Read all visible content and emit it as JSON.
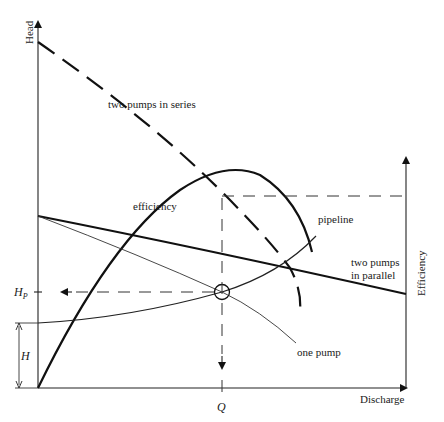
{
  "diagram": {
    "type": "pump performance / system characteristic curves",
    "axes": {
      "y_left_label": "Head",
      "x_label": "Discharge",
      "y_right_label": "Efficiency"
    },
    "curves": {
      "series": "two pumps in series",
      "efficiency": "efficiency",
      "pipeline": "pipeline",
      "parallel_line1": "two pumps",
      "parallel_line2": "in parallel",
      "one_pump": "one pump"
    },
    "markers": {
      "operating_head": "H",
      "operating_head_sub": "P",
      "static_head": "H",
      "operating_discharge": "Q"
    },
    "colors": {
      "ink": "#111111",
      "background": "#ffffff"
    }
  }
}
